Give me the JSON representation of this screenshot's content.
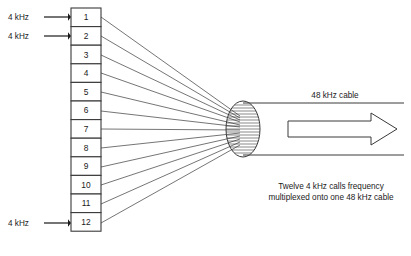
{
  "diagram": {
    "title_caption_lines": [
      "Twelve 4 kHz calls frequency",
      "multiplexed onto one 48 kHz cable"
    ],
    "cable_label": "48 kHz cable",
    "input_labels": [
      {
        "text": "4 kHz",
        "channel": "1"
      },
      {
        "text": "4 kHz",
        "channel": "2"
      },
      {
        "text": "4 kHz",
        "channel": "12"
      }
    ],
    "channels": [
      {
        "number": "1"
      },
      {
        "number": "2"
      },
      {
        "number": "3"
      },
      {
        "number": "4"
      },
      {
        "number": "5"
      },
      {
        "number": "6"
      },
      {
        "number": "7"
      },
      {
        "number": "8"
      },
      {
        "number": "9"
      },
      {
        "number": "10"
      },
      {
        "number": "11"
      },
      {
        "number": "12"
      }
    ],
    "colors": {
      "line": "#3a3a3a",
      "text": "#1a1a1a",
      "background": "#ffffff"
    }
  }
}
